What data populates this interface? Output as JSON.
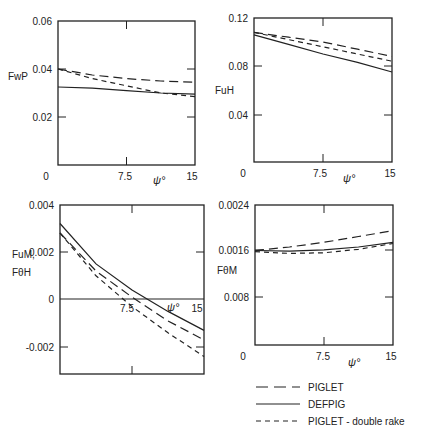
{
  "chart_data": [
    {
      "type": "line",
      "ylabel": "FwP",
      "xlabel": "ψ°",
      "x_ticks": [
        "0",
        "7.5",
        "15"
      ],
      "y_ticks": [
        "0.06",
        "0.04",
        "0.02"
      ],
      "xlim": [
        0,
        15
      ],
      "ylim": [
        0,
        0.06
      ],
      "x": [
        0,
        3.75,
        7.5,
        11.25,
        15
      ],
      "series": [
        {
          "name": "PIGLET",
          "values": [
            0.04,
            0.0375,
            0.036,
            0.035,
            0.0345
          ]
        },
        {
          "name": "DEFPIG",
          "values": [
            0.0325,
            0.032,
            0.031,
            0.03,
            0.0295
          ]
        },
        {
          "name": "PIGLET - double rake",
          "values": [
            0.04,
            0.036,
            0.033,
            0.03,
            0.0285
          ]
        }
      ]
    },
    {
      "type": "line",
      "ylabel": "FuH",
      "xlabel": "ψ°",
      "x_ticks": [
        "0",
        "7.5",
        "15"
      ],
      "y_ticks": [
        "0.12",
        "0.08",
        "0.04"
      ],
      "xlim": [
        0,
        15
      ],
      "ylim": [
        0,
        0.12
      ],
      "x": [
        0,
        3.75,
        7.5,
        11.25,
        15
      ],
      "series": [
        {
          "name": "PIGLET",
          "values": [
            0.108,
            0.104,
            0.1,
            0.094,
            0.088
          ]
        },
        {
          "name": "DEFPIG",
          "values": [
            0.106,
            0.098,
            0.09,
            0.083,
            0.075
          ]
        },
        {
          "name": "PIGLET - double rake",
          "values": [
            0.108,
            0.102,
            0.096,
            0.09,
            0.084
          ]
        }
      ]
    },
    {
      "type": "line",
      "ylabel": "FuM, FθH",
      "xlabel": "ψ°",
      "x_ticks": [
        "7.5",
        "15"
      ],
      "y_ticks": [
        "0.004",
        "0.002",
        "0",
        "-0.002"
      ],
      "xlim": [
        0,
        15
      ],
      "ylim": [
        -0.0028,
        0.004
      ],
      "x": [
        0,
        3.75,
        7.5,
        11.25,
        15
      ],
      "series": [
        {
          "name": "PIGLET",
          "values": [
            0.0028,
            0.0012,
            0.0001,
            -0.0009,
            -0.0017
          ]
        },
        {
          "name": "DEFPIG",
          "values": [
            0.0032,
            0.0015,
            0.0004,
            -0.0005,
            -0.0013
          ]
        },
        {
          "name": "PIGLET - double rake",
          "values": [
            0.0028,
            0.001,
            -0.0003,
            -0.0014,
            -0.0024
          ]
        }
      ]
    },
    {
      "type": "line",
      "ylabel": "FθM",
      "xlabel": "ψ°",
      "x_ticks": [
        "0",
        "7.5",
        "15"
      ],
      "y_ticks": [
        "0.0024",
        "0.0016",
        "0.008"
      ],
      "xlim": [
        0,
        15
      ],
      "ylim": [
        0,
        0.0024
      ],
      "x": [
        0,
        3.75,
        7.5,
        11.25,
        15
      ],
      "series": [
        {
          "name": "PIGLET",
          "values": [
            0.00162,
            0.00168,
            0.00176,
            0.00186,
            0.00196
          ]
        },
        {
          "name": "DEFPIG",
          "values": [
            0.00162,
            0.00161,
            0.00163,
            0.00168,
            0.00176
          ]
        },
        {
          "name": "PIGLET - double rake",
          "values": [
            0.0016,
            0.00157,
            0.00158,
            0.00164,
            0.00174
          ]
        }
      ]
    }
  ],
  "legend": [
    {
      "label": "PIGLET",
      "style": "long-dash"
    },
    {
      "label": "DEFPIG",
      "style": "solid"
    },
    {
      "label": "PIGLET - double rake",
      "style": "short-dash"
    }
  ]
}
